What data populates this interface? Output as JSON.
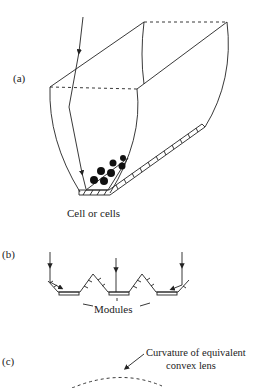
{
  "panels": {
    "a": {
      "label": "(a)",
      "caption": "Cell or cells"
    },
    "b": {
      "label": "(b)",
      "caption": "Modules"
    },
    "c": {
      "label": "(c)",
      "caption_line1": "Curvature of equivalent",
      "caption_line2": "convex lens"
    }
  },
  "colors": {
    "ink": "#222222",
    "background": "#ffffff"
  }
}
